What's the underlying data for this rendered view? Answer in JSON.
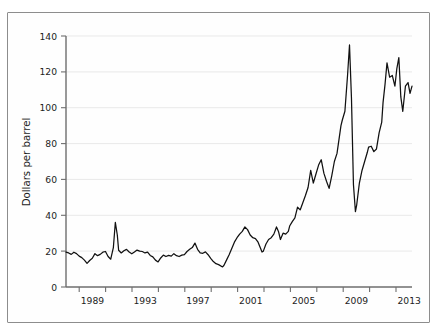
{
  "figure": {
    "background_color": "#ffffff",
    "frame_color": "#8d8d8d",
    "line_color": "#111111",
    "grid_color": "#e9e9e9",
    "axis_color": "#6e6e6e"
  },
  "axes": {
    "ylabel": "Dollars per barrel",
    "y_ticks": [
      "0",
      "20",
      "40",
      "60",
      "80",
      "100",
      "120",
      "140"
    ],
    "x_ticks": [
      "1989",
      "1993",
      "1997",
      "2001",
      "2005",
      "2009",
      "2013"
    ]
  },
  "chart_data": {
    "type": "line",
    "title": "",
    "subtitle": "",
    "xlabel": "",
    "ylabel": "Dollars per barrel",
    "xlim": [
      1987.0,
      2013.3
    ],
    "ylim": [
      0,
      140
    ],
    "yticks": [
      0,
      20,
      40,
      60,
      80,
      100,
      120,
      140
    ],
    "xticks": [
      1989,
      1993,
      1997,
      2001,
      2005,
      2009,
      2013
    ],
    "xtick_minor_step": 2,
    "grid": "horizontal",
    "legend": "none",
    "series": [
      {
        "name": "Crude oil price",
        "units": "Dollars per barrel",
        "x": [
          1987.0,
          1987.2,
          1987.4,
          1987.6,
          1987.8,
          1988.0,
          1988.2,
          1988.4,
          1988.6,
          1988.8,
          1989.0,
          1989.2,
          1989.4,
          1989.6,
          1989.8,
          1990.0,
          1990.2,
          1990.4,
          1990.6,
          1990.75,
          1990.9,
          1991.0,
          1991.2,
          1991.4,
          1991.6,
          1991.8,
          1992.0,
          1992.2,
          1992.4,
          1992.6,
          1992.8,
          1993.0,
          1993.2,
          1993.4,
          1993.6,
          1993.8,
          1994.0,
          1994.2,
          1994.4,
          1994.6,
          1994.8,
          1995.0,
          1995.2,
          1995.4,
          1995.6,
          1995.8,
          1996.0,
          1996.2,
          1996.4,
          1996.6,
          1996.8,
          1997.0,
          1997.2,
          1997.4,
          1997.6,
          1997.8,
          1998.0,
          1998.2,
          1998.4,
          1998.6,
          1998.9,
          1999.0,
          1999.2,
          1999.4,
          1999.6,
          1999.8,
          2000.0,
          2000.2,
          2000.4,
          2000.6,
          2000.8,
          2001.0,
          2001.2,
          2001.4,
          2001.6,
          2001.9,
          2002.0,
          2002.2,
          2002.4,
          2002.6,
          2002.8,
          2003.0,
          2003.15,
          2003.3,
          2003.5,
          2003.7,
          2003.9,
          2004.0,
          2004.2,
          2004.4,
          2004.6,
          2004.8,
          2005.0,
          2005.2,
          2005.4,
          2005.6,
          2005.8,
          2006.0,
          2006.2,
          2006.4,
          2006.6,
          2006.8,
          2007.0,
          2007.2,
          2007.4,
          2007.6,
          2007.9,
          2008.0,
          2008.2,
          2008.4,
          2008.55,
          2008.7,
          2008.85,
          2009.0,
          2009.1,
          2009.3,
          2009.5,
          2009.7,
          2009.9,
          2010.0,
          2010.2,
          2010.4,
          2010.6,
          2010.8,
          2011.0,
          2011.1,
          2011.25,
          2011.4,
          2011.6,
          2011.8,
          2012.0,
          2012.15,
          2012.3,
          2012.45,
          2012.6,
          2012.8,
          2013.0,
          2013.15,
          2013.3
        ],
        "y": [
          19.5,
          19.0,
          18.2,
          19.4,
          18.6,
          17.2,
          16.4,
          15.0,
          13.2,
          14.8,
          16.0,
          18.6,
          17.5,
          18.2,
          19.4,
          19.8,
          17.0,
          15.5,
          22.0,
          36.0,
          29.0,
          20.5,
          19.0,
          20.2,
          21.0,
          19.5,
          18.5,
          19.5,
          20.6,
          20.0,
          19.8,
          19.0,
          19.5,
          17.6,
          16.8,
          15.0,
          14.0,
          16.2,
          17.8,
          17.0,
          17.6,
          17.2,
          18.6,
          17.5,
          17.0,
          17.8,
          18.0,
          19.8,
          21.0,
          22.0,
          24.5,
          21.0,
          19.0,
          18.8,
          19.6,
          18.0,
          16.0,
          14.2,
          13.0,
          12.5,
          11.2,
          12.0,
          15.0,
          18.0,
          21.5,
          25.0,
          27.5,
          29.5,
          31.0,
          33.5,
          32.0,
          29.0,
          27.5,
          27.0,
          25.0,
          19.5,
          20.0,
          24.0,
          26.5,
          27.5,
          29.5,
          33.5,
          31.0,
          26.5,
          30.0,
          29.5,
          31.0,
          34.0,
          36.5,
          38.5,
          44.5,
          43.0,
          47.0,
          51.0,
          55.5,
          65.0,
          58.0,
          63.0,
          68.0,
          71.0,
          63.5,
          59.0,
          55.0,
          62.0,
          70.0,
          74.5,
          90.0,
          93.0,
          98.0,
          118.0,
          135.0,
          105.0,
          57.0,
          42.0,
          46.0,
          58.0,
          65.0,
          70.0,
          75.0,
          78.0,
          78.5,
          75.5,
          77.0,
          86.0,
          92.0,
          103.0,
          113.0,
          125.0,
          117.0,
          118.0,
          112.0,
          122.0,
          128.0,
          106.0,
          98.0,
          112.0,
          114.0,
          108.0,
          112.0
        ]
      }
    ],
    "annotations": [
      {
        "label": "1990 Gulf War spike",
        "x": 1990.75,
        "y": 36
      },
      {
        "label": "1998 low",
        "x": 1998.9,
        "y": 11.2
      },
      {
        "label": "2008 peak",
        "x": 2008.55,
        "y": 135
      },
      {
        "label": "2009 crash trough",
        "x": 2009.0,
        "y": 42
      }
    ]
  }
}
